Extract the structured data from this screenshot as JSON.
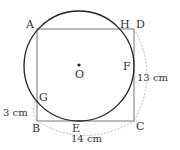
{
  "diagram": {
    "colors": {
      "circle": "#222222",
      "rectangle": "#777777",
      "dimension": "#aaaaaa",
      "text": "#333333"
    },
    "points": {
      "A": "A",
      "B": "B",
      "C": "C",
      "D": "D",
      "E": "E",
      "F": "F",
      "G": "G",
      "H": "H",
      "O": "O"
    },
    "dimensions": {
      "BG": "3 cm",
      "BC": "14 cm",
      "CD": "13 cm"
    }
  }
}
